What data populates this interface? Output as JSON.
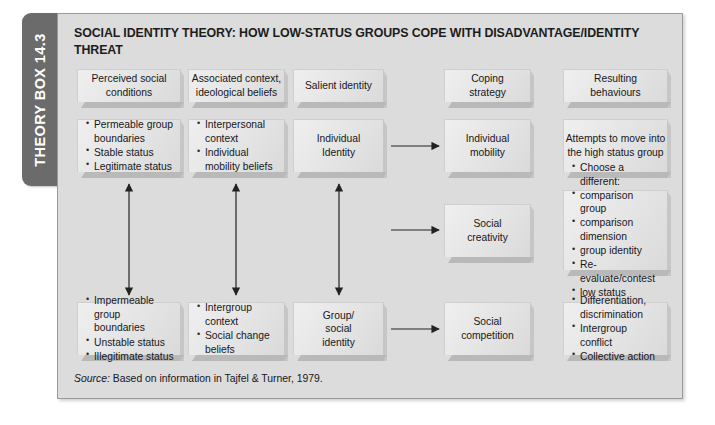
{
  "tab": {
    "label": "THEORY BOX 14.3"
  },
  "panel": {
    "title": "SOCIAL IDENTITY THEORY: HOW LOW-STATUS GROUPS COPE WITH DISADVANTAGE/IDENTITY THREAT",
    "source_label": "Source:",
    "source_text": " Based on information in Tajfel & Turner, 1979."
  },
  "headers": [
    {
      "line1": "Perceived social",
      "line2": "conditions"
    },
    {
      "line1": "Associated context,",
      "line2": "ideological beliefs"
    },
    {
      "line1": "Salient identity",
      "line2": ""
    },
    {
      "line1": "Coping",
      "line2": "strategy"
    },
    {
      "line1": "Resulting",
      "line2": "behaviours"
    }
  ],
  "boxes": {
    "perceived_top": [
      "Permeable group boundaries",
      "Stable status",
      "Legitimate status"
    ],
    "context_top": [
      "Interpersonal context",
      "Individual mobility beliefs"
    ],
    "individual_identity": {
      "line1": "Individual",
      "line2": "Identity"
    },
    "individual_mobility": {
      "line1": "Individual",
      "line2": "mobility"
    },
    "attempts": {
      "line1": "Attempts to move into",
      "line2": "the high status group"
    },
    "social_creativity": {
      "line1": "Social",
      "line2": "creativity"
    },
    "choose_different": {
      "heading": "Choose a different:",
      "bullets": [
        "comparison group",
        "comparison dimension",
        "group identity"
      ],
      "tail": [
        "Re-evaluate/contest",
        "low status"
      ]
    },
    "perceived_bottom": [
      "Impermeable group boundaries",
      "Unstable status",
      "Illegitimate status"
    ],
    "context_bottom": [
      "Intergroup context",
      "Social change beliefs"
    ],
    "group_social_identity": {
      "line1": "Group/",
      "line2": "social",
      "line3": "identity"
    },
    "social_competition": {
      "line1": "Social",
      "line2": "competition"
    },
    "outcomes_bottom": [
      "Differentiation, discrimination",
      "Intergroup conflict",
      "Collective action"
    ]
  },
  "colors": {
    "tab_bg": "#6b6b6b",
    "panel_bg": "#dcdcdc",
    "box_bg": "#e8e8e8",
    "arrow": "#222222",
    "text": "#17171a"
  }
}
